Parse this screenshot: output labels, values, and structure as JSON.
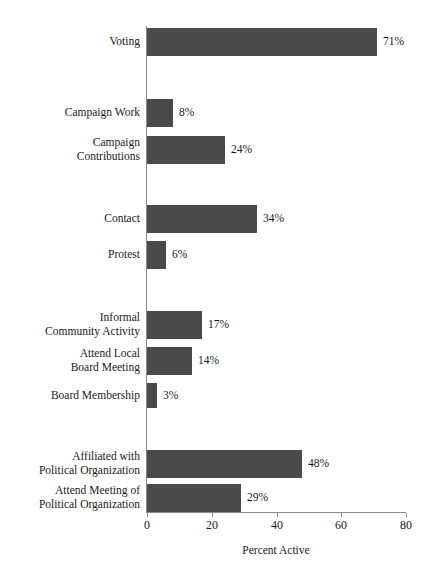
{
  "chart_data": {
    "type": "bar",
    "orientation": "horizontal",
    "title": "",
    "xlabel": "Percent Active",
    "ylabel": "",
    "xlim": [
      0,
      80
    ],
    "xticks": [
      0,
      20,
      40,
      60,
      80
    ],
    "xtick_labels": [
      "0",
      "20",
      "40",
      "60",
      "80"
    ],
    "grid": false,
    "legend": null,
    "bar_color": "#4a4a4a",
    "axis_color": "#8c8c8c",
    "value_label_suffix": "%",
    "categories": [
      "Voting",
      "Campaign Work",
      "Campaign\nContributions",
      "Contact",
      "Protest",
      "Informal\nCommunity Activity",
      "Attend Local\nBoard Meeting",
      "Board Membership",
      "Affiliated with\nPolitical Organization",
      "Attend Meeting of\nPolitical Organization"
    ],
    "values": [
      71,
      8,
      24,
      34,
      6,
      17,
      14,
      3,
      48,
      29
    ],
    "value_labels": [
      "71%",
      "8%",
      "24%",
      "34%",
      "6%",
      "17%",
      "14%",
      "3%",
      "48%",
      "29%"
    ],
    "groups": [
      {
        "name": "electoral",
        "category_indices": [
          0
        ]
      },
      {
        "name": "campaign",
        "category_indices": [
          1,
          2
        ]
      },
      {
        "name": "contact-protest",
        "category_indices": [
          3,
          4
        ]
      },
      {
        "name": "community",
        "category_indices": [
          5,
          6,
          7
        ]
      },
      {
        "name": "political-organization",
        "category_indices": [
          8,
          9
        ]
      }
    ],
    "bars": [
      {
        "label": "Voting",
        "value": 71,
        "value_label": "71%",
        "top": 28,
        "height": 28
      },
      {
        "label": "Campaign Work",
        "value": 8,
        "value_label": "8%",
        "top": 99,
        "height": 28
      },
      {
        "label": "Campaign\nContributions",
        "value": 24,
        "value_label": "24%",
        "top": 136,
        "height": 28
      },
      {
        "label": "Contact",
        "value": 34,
        "value_label": "34%",
        "top": 205,
        "height": 28
      },
      {
        "label": "Protest",
        "value": 6,
        "value_label": "6%",
        "top": 241,
        "height": 28
      },
      {
        "label": "Informal\nCommunity Activity",
        "value": 17,
        "value_label": "17%",
        "top": 311,
        "height": 28
      },
      {
        "label": "Attend Local\nBoard Meeting",
        "value": 14,
        "value_label": "14%",
        "top": 347,
        "height": 28
      },
      {
        "label": "Board Membership",
        "value": 3,
        "value_label": "3%",
        "top": 383,
        "height": 25
      },
      {
        "label": "Affiliated with\nPolitical Organization",
        "value": 48,
        "value_label": "48%",
        "top": 450,
        "height": 28
      },
      {
        "label": "Attend Meeting of\nPolitical Organization",
        "value": 29,
        "value_label": "29%",
        "top": 484,
        "height": 28
      }
    ]
  }
}
